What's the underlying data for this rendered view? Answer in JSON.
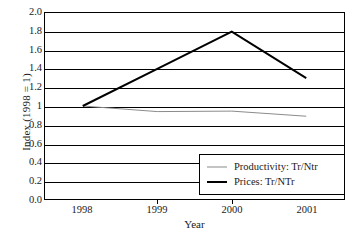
{
  "chart_data": {
    "type": "line",
    "title": "",
    "xlabel": "Year",
    "ylabel": "Index (1998 = 1)",
    "x": [
      "1998",
      "1999",
      "2000",
      "2001"
    ],
    "categories": [
      "1998",
      "1999",
      "2000",
      "2001"
    ],
    "xlim": [
      1998,
      2001
    ],
    "ylim": [
      0.0,
      2.0
    ],
    "grid": true,
    "legend_position": "bottom-right inside plot area",
    "y_ticks": [
      "0.0",
      "0.2",
      "0.4",
      "0.6",
      "0.8",
      "1",
      "1.2",
      "1.4",
      "1.6",
      "1.8",
      "2.0"
    ],
    "y_tick_values": [
      0.0,
      0.2,
      0.4,
      0.6,
      0.8,
      1.0,
      1.2,
      1.4,
      1.6,
      1.8,
      2.0
    ],
    "series": [
      {
        "name": "Productivity: Tr/Ntr",
        "values": [
          1.0,
          0.94,
          0.945,
          0.89
        ],
        "color": "#8a8a8a",
        "width": "thin"
      },
      {
        "name": "Prices: Tr/NTr",
        "values": [
          1.0,
          1.4,
          1.8,
          1.3
        ],
        "color": "#000000",
        "width": "thick"
      }
    ]
  },
  "legend": {
    "items": [
      {
        "label": "Productivity: Tr/Ntr",
        "style": "thin"
      },
      {
        "label": "Prices: Tr/NTr",
        "style": "thick"
      }
    ]
  },
  "caption": {
    "sliver_text": ""
  }
}
